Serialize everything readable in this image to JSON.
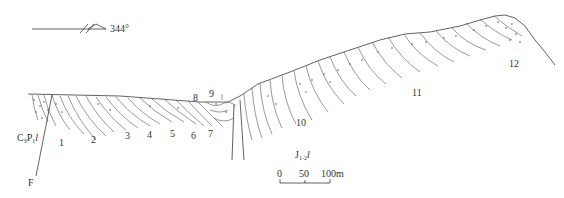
{
  "orientation": {
    "azimuth_label": "344°"
  },
  "formations": {
    "left": {
      "base": "C",
      "base_sub": "3",
      "mid": "P",
      "mid_sub": "1",
      "suffix": "l"
    },
    "right": {
      "base": "J",
      "base_sub": "1-2",
      "suffix": "l"
    }
  },
  "fault_label": "F",
  "layer_numbers": [
    "1",
    "2",
    "3",
    "4",
    "5",
    "6",
    "7",
    "8",
    "9",
    "10",
    "11",
    "12"
  ],
  "scale_bar": {
    "tick_labels": [
      "0",
      "50",
      "100m"
    ]
  },
  "colors": {
    "ink": "#3a3a3a",
    "background": "#ffffff"
  }
}
